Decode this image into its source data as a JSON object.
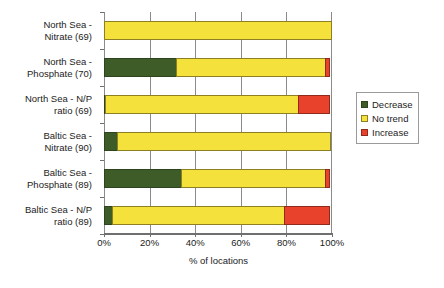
{
  "chart_data": {
    "type": "bar",
    "orientation": "horizontal",
    "stacked": true,
    "title": "",
    "xlabel": "% of locations",
    "ylabel": "",
    "xlim": [
      0,
      100
    ],
    "xticks": [
      "0%",
      "20%",
      "40%",
      "60%",
      "80%",
      "100%"
    ],
    "xtick_values": [
      0,
      20,
      40,
      60,
      80,
      100
    ],
    "grid": true,
    "legend_position": "right",
    "categories": [
      "North Sea - Nitrate (69)",
      "North Sea - Phosphate (70)",
      "North Sea - N/P ratio (69)",
      "Baltic Sea - Nitrate (90)",
      "Baltic Sea - Phosphate (89)",
      "Baltic Sea - N/P ratio (89)"
    ],
    "category_lines": [
      [
        "North Sea -",
        "Nitrate (69)"
      ],
      [
        "North Sea -",
        "Phosphate (70)"
      ],
      [
        "North Sea - N/P",
        "ratio (69)"
      ],
      [
        "Baltic Sea -",
        "Nitrate (90)"
      ],
      [
        "Baltic Sea -",
        "Phosphate (89)"
      ],
      [
        "Baltic Sea - N/P",
        "ratio (89)"
      ]
    ],
    "series": [
      {
        "name": "Decrease",
        "color": "#3d5c28",
        "values": [
          0,
          32,
          1,
          6,
          34,
          4
        ]
      },
      {
        "name": "No trend",
        "color": "#f5e13c",
        "values": [
          100,
          66,
          85,
          94,
          64,
          76
        ]
      },
      {
        "name": "Increase",
        "color": "#e8412c",
        "values": [
          0,
          2,
          14,
          0,
          2,
          20
        ]
      }
    ]
  },
  "legend": {
    "items": [
      {
        "label": "Decrease"
      },
      {
        "label": "No trend"
      },
      {
        "label": "Increase"
      }
    ]
  },
  "colors": {
    "decrease": "#3d5c28",
    "no_trend": "#f5e13c",
    "increase": "#e8412c",
    "axis": "#6f6f6f",
    "grid": "#8a8a8a",
    "background": "#ffffff"
  }
}
